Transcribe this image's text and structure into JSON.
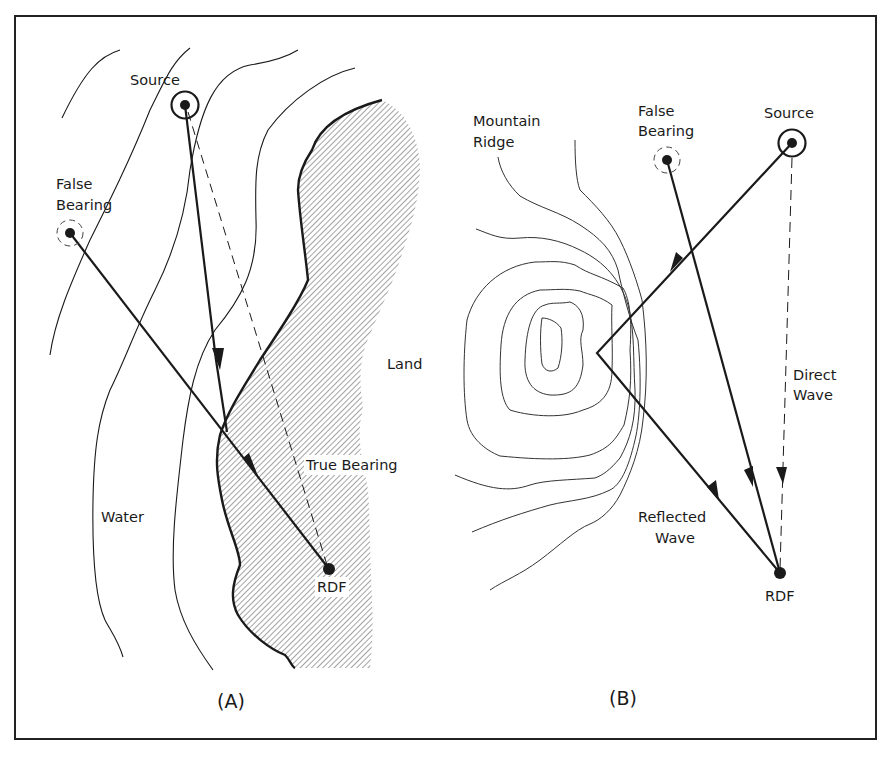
{
  "figure": {
    "panels": [
      {
        "id": "A",
        "caption": "(A)",
        "labels": {
          "source": "Source",
          "false_bearing_1": "False",
          "false_bearing_2": "Bearing",
          "land": "Land",
          "true_bearing": "True Bearing",
          "water": "Water",
          "rdf": "RDF"
        }
      },
      {
        "id": "B",
        "caption": "(B)",
        "labels": {
          "mountain_ridge_1": "Mountain",
          "mountain_ridge_2": "Ridge",
          "false_bearing_1": "False",
          "false_bearing_2": "Bearing",
          "source": "Source",
          "direct_wave_1": "Direct",
          "direct_wave_2": "Wave",
          "reflected_wave_1": "Reflected",
          "reflected_wave_2": "Wave",
          "rdf": "RDF"
        }
      }
    ],
    "colors": {
      "ink": "#1a1a1a",
      "hatch": "#555555",
      "background": "#ffffff"
    }
  }
}
